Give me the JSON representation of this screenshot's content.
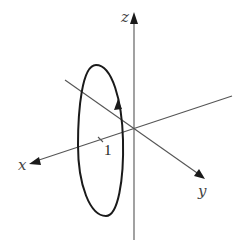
{
  "diagram": {
    "axes": {
      "x": {
        "label": "x"
      },
      "y": {
        "label": "y"
      },
      "z": {
        "label": "z"
      }
    },
    "tick": {
      "axis": "x",
      "value": "1",
      "label": "1"
    },
    "curve": {
      "shape": "ellipse",
      "direction_arrow": "up",
      "color": "#1a1a1a"
    },
    "colors": {
      "axes": "#555555",
      "curve": "#1a1a1a",
      "background": "#ffffff"
    }
  }
}
